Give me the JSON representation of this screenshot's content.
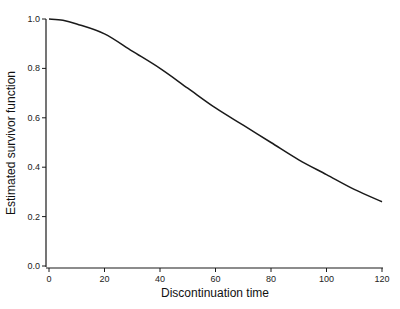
{
  "chart_data": {
    "type": "line",
    "title": "",
    "xlabel": "Discontinuation time",
    "ylabel": "Estimated survivor function",
    "xlim": [
      0,
      120
    ],
    "ylim": [
      0.0,
      1.0
    ],
    "x_ticks": [
      "0",
      "20",
      "40",
      "60",
      "80",
      "100",
      "120"
    ],
    "y_ticks": [
      "0.0",
      "0.2",
      "0.4",
      "0.6",
      "0.8",
      "1.0"
    ],
    "grid": false,
    "legend": null,
    "series": [
      {
        "name": "Estimated survivor function",
        "color": "#1a1a1a",
        "x": [
          0,
          5,
          10,
          20,
          30,
          40,
          50,
          60,
          70,
          80,
          90,
          100,
          110,
          120
        ],
        "values": [
          1.0,
          0.995,
          0.98,
          0.94,
          0.87,
          0.8,
          0.72,
          0.64,
          0.57,
          0.5,
          0.43,
          0.37,
          0.31,
          0.26
        ]
      }
    ]
  }
}
